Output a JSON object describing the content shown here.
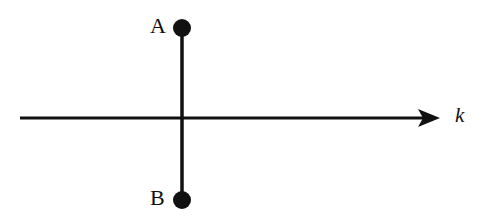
{
  "figure": {
    "background_color": "#ffffff",
    "stroke_color": "#111111",
    "width": 485,
    "height": 216,
    "labels": {
      "top_node": "A",
      "bottom_node": "B",
      "axis": "k"
    },
    "nodes": [
      {
        "name": "node-a",
        "label": "A",
        "cx": 182,
        "cy": 28,
        "r": 9,
        "fill": "#111111"
      },
      {
        "name": "node-b",
        "label": "B",
        "cx": 182,
        "cy": 200,
        "r": 9,
        "fill": "#111111"
      }
    ],
    "vertical_rod": {
      "name": "vertical-rod",
      "x": 182,
      "y1": 28,
      "y2": 200,
      "thickness": 3.5
    },
    "horizontal_axis": {
      "name": "horizontal-axis",
      "y": 118,
      "x1": 20,
      "x2": 440,
      "thickness": 3,
      "arrowhead": {
        "name": "axis-arrowhead",
        "tip_x": 440,
        "base_x": 418,
        "half_height": 9
      }
    }
  }
}
